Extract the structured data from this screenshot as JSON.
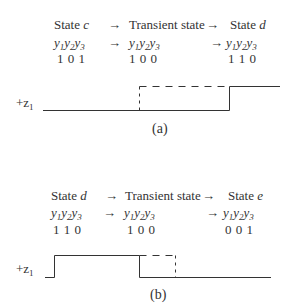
{
  "panels": [
    {
      "id": "a",
      "caption": "(a)",
      "row1": {
        "from": "State",
        "from_var": "c",
        "arrow1": "→",
        "mid": "Transient state",
        "arrow2": "→",
        "to": "State",
        "to_var": "d"
      },
      "row2": {
        "vars": [
          "y",
          "1",
          "y",
          "2",
          "y",
          "3"
        ],
        "arrow1": "→",
        "arrow2": "→"
      },
      "row3": {
        "from_bits": "1 0 1",
        "mid_bits": "1 0 0",
        "to_bits": "1 1 0"
      },
      "signal_label": "+z",
      "signal_sub": "1"
    },
    {
      "id": "b",
      "caption": "(b)",
      "row1": {
        "from": "State",
        "from_var": "d",
        "arrow1": "→",
        "mid": "Transient state",
        "arrow2": "→",
        "to": "State",
        "to_var": "e"
      },
      "row2": {
        "vars": [
          "y",
          "1",
          "y",
          "2",
          "y",
          "3"
        ],
        "arrow1": "→",
        "arrow2": "→"
      },
      "row3": {
        "from_bits": "1 1 0",
        "mid_bits": "1 0 0",
        "to_bits": "0 0 1"
      },
      "signal_label": "+z",
      "signal_sub": "1"
    }
  ]
}
